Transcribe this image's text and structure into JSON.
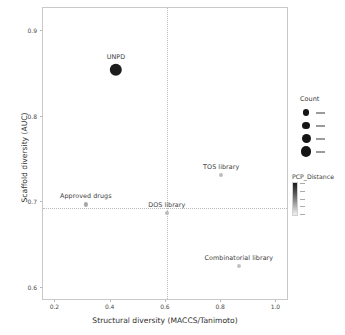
{
  "chart_data": {
    "type": "scatter",
    "title": "",
    "xlabel": "Structural diversity (MACCS/Tanimoto)",
    "ylabel": "Scaffold diversity (AUC)",
    "xlim": [
      0.155,
      1.0455
    ],
    "ylim": [
      0.5845,
      0.9275
    ],
    "xticks": [
      "0.2",
      "0.4",
      "0.6",
      "0.8",
      "1.0"
    ],
    "xtick_values": [
      0.2,
      0.4,
      0.6,
      0.8,
      1.0
    ],
    "yticks": [
      "0.9",
      "0.8",
      "0.7",
      "0.6"
    ],
    "ytick_values": [
      0.9,
      0.8,
      0.7,
      0.6
    ],
    "grid": false,
    "legend_position": "right",
    "reference_lines": [
      {
        "orientation": "vertical",
        "value": 0.603,
        "style": "dotted"
      },
      {
        "orientation": "horizontal",
        "value": 0.6935,
        "style": "dotted"
      }
    ],
    "points": [
      {
        "label": "UNPD",
        "x": 0.419,
        "y": 0.8555,
        "size": 12.4,
        "color": "#1c1c1c"
      },
      {
        "label": "TOS library",
        "x": 0.8,
        "y": 0.7325,
        "size": 4.0,
        "color": "#bdbdbd"
      },
      {
        "label": "Approved drugs",
        "x": 0.31,
        "y": 0.6975,
        "size": 4.2,
        "color": "#a8a8a8"
      },
      {
        "label": "DOS library",
        "x": 0.603,
        "y": 0.6875,
        "size": 4.0,
        "color": "#bcbcbc"
      },
      {
        "label": "Combinatorial library",
        "x": 0.864,
        "y": 0.6255,
        "size": 4.0,
        "color": "#c2c2c2"
      }
    ],
    "legends": [
      {
        "name": "count-legend",
        "title": "Count",
        "type": "size",
        "entries": [
          {
            "key": "",
            "size": 6.2
          },
          {
            "key": "",
            "size": 7.6
          },
          {
            "key": "",
            "size": 9.0
          },
          {
            "key": "",
            "size": 10.6
          }
        ]
      },
      {
        "name": "pcp-distance-legend",
        "title": "PCP_Distance",
        "type": "colorbar",
        "entries": [
          {
            "key": ""
          },
          {
            "key": ""
          },
          {
            "key": ""
          },
          {
            "key": ""
          },
          {
            "key": ""
          }
        ]
      }
    ]
  },
  "colors": {
    "panel_border": "#c9c9c9",
    "reference_line": "#b9b9b9",
    "text": "#3d3d3d",
    "background": "#ffffff"
  }
}
